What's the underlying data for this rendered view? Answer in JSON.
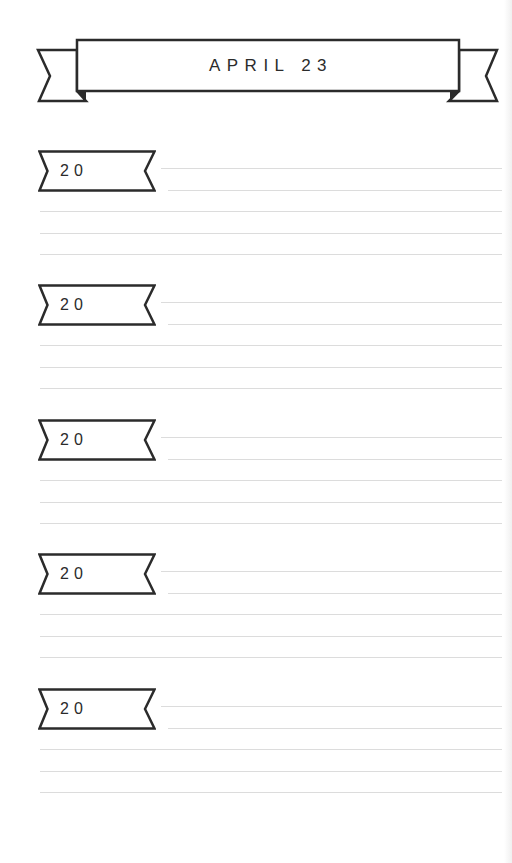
{
  "header": {
    "title": "APRIL 23",
    "icon": "ribbon-banner"
  },
  "entries": [
    {
      "year_prefix": "20",
      "year_value": "",
      "lines": [
        "",
        "",
        "",
        "",
        ""
      ]
    },
    {
      "year_prefix": "20",
      "year_value": "",
      "lines": [
        "",
        "",
        "",
        "",
        ""
      ]
    },
    {
      "year_prefix": "20",
      "year_value": "",
      "lines": [
        "",
        "",
        "",
        "",
        ""
      ]
    },
    {
      "year_prefix": "20",
      "year_value": "",
      "lines": [
        "",
        "",
        "",
        "",
        ""
      ]
    },
    {
      "year_prefix": "20",
      "year_value": "",
      "lines": [
        "",
        "",
        "",
        "",
        ""
      ]
    }
  ],
  "colors": {
    "ink": "#2b2b2b",
    "rule": "#dcdcdc",
    "paper": "#ffffff"
  }
}
